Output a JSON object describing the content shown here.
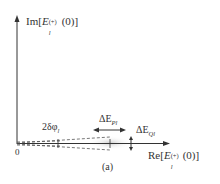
{
  "diagram": {
    "panel_label": "(a)",
    "axes": {
      "y_label_prefix": "Im[",
      "y_label_symbol": "E",
      "y_label_sup": "(+)",
      "y_label_sub": "l",
      "y_label_suffix": "(0)]",
      "x_label_prefix": "Re[",
      "x_label_symbol": "E",
      "x_label_sup": "(+)",
      "x_label_sub": "l",
      "x_label_suffix": "(0)]",
      "origin_label": "0"
    },
    "annotations": {
      "phase_width": "2δφ",
      "phase_width_sub": "l",
      "delta_P": "ΔE",
      "delta_P_sub": "Pl",
      "delta_Q": "ΔE",
      "delta_Q_sub": "Ql"
    },
    "colors": {
      "axis": "#333333",
      "dashed": "#555555",
      "blob": "#d9d9d9"
    }
  }
}
